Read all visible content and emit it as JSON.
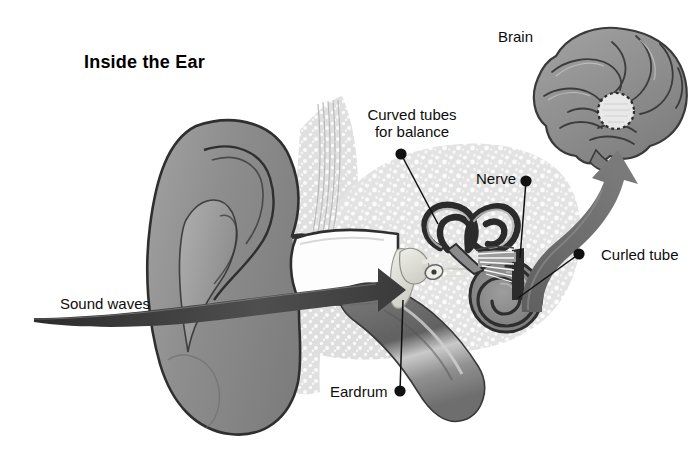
{
  "figure": {
    "title": "Inside the Ear",
    "background_color": "#ffffff"
  },
  "palette": {
    "ink": "#111111",
    "outline_dark": "#2e2e2e",
    "tissue_grey": "#8f8f8f",
    "tissue_grey_light": "#a8a8a8",
    "tissue_grey_dark": "#6f6f6f",
    "bone_speckle": "#dcdcdc",
    "bone_base": "#e9e9e9",
    "arrow_grey": "#6a6a6a",
    "arrow_dark": "#4a4a4a",
    "ossicle_light": "#e2e2e0",
    "brain_grey": "#949494",
    "highlight_circle": "#e6e6e6"
  },
  "labels": [
    {
      "id": "brain",
      "text": "Brain",
      "x": 498,
      "y": 28,
      "has_dot": false,
      "has_leader": false
    },
    {
      "id": "curved-tubes-for-balance",
      "text": "Curved tubes\nfor balance",
      "line1": "Curved tubes",
      "line2": "for balance",
      "x": 357,
      "y": 106,
      "has_dot": true,
      "dot_x": 401,
      "dot_y": 154,
      "leader_to_x": 438,
      "leader_to_y": 224,
      "has_leader": true
    },
    {
      "id": "nerve",
      "text": "Nerve",
      "x": 476,
      "y": 170,
      "has_dot": true,
      "dot_x": 526,
      "dot_y": 181,
      "leader_to_x": 520,
      "leader_to_y": 258,
      "has_leader": true
    },
    {
      "id": "curled-tube",
      "text": "Curled tube",
      "x": 601,
      "y": 246,
      "has_dot": true,
      "dot_x": 579,
      "dot_y": 254,
      "leader_to_x": 518,
      "leader_to_y": 298,
      "has_leader": true
    },
    {
      "id": "sound-waves",
      "text": "Sound waves",
      "x": 60,
      "y": 295,
      "has_dot": false,
      "has_leader": false
    },
    {
      "id": "eardrum",
      "text": "Eardrum",
      "x": 330,
      "y": 383,
      "has_dot": true,
      "dot_x": 400,
      "dot_y": 391,
      "leader_to_x": 403,
      "leader_to_y": 300,
      "has_leader": true
    }
  ],
  "anatomy_parts": [
    {
      "id": "pinna",
      "name": "outer ear / pinna"
    },
    {
      "id": "ear-canal",
      "name": "ear canal"
    },
    {
      "id": "eardrum-membrane",
      "name": "eardrum"
    },
    {
      "id": "ossicles",
      "name": "ossicles"
    },
    {
      "id": "semicircular-canals",
      "name": "curved tubes for balance"
    },
    {
      "id": "cochlea",
      "name": "curled tube"
    },
    {
      "id": "auditory-nerve",
      "name": "nerve"
    },
    {
      "id": "eustachian-tube",
      "name": "eustachian tube"
    },
    {
      "id": "skull-bone",
      "name": "skull bone"
    },
    {
      "id": "brain-organ",
      "name": "brain"
    },
    {
      "id": "auditory-cortex-spot",
      "name": "auditory cortex"
    }
  ],
  "arrows": [
    {
      "id": "sound-wave-arrow",
      "from": "outside left",
      "to": "ear canal / eardrum",
      "color": "#4d4d4d"
    },
    {
      "id": "nerve-signal-arrow",
      "from": "inner ear",
      "to": "brain",
      "color": "#6d6d6d"
    }
  ]
}
